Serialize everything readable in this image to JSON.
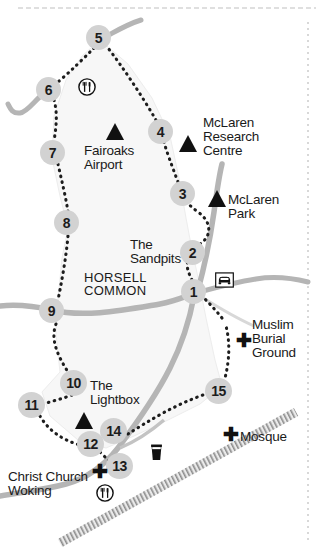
{
  "map": {
    "title": "Horsell Common walking route map",
    "background_color": "#ffffff",
    "land_color": "#f6f6f6",
    "road_color": "#b3b3b3",
    "marker_fill": "#d2d2d2",
    "marker_text_color": "#1c1c1c",
    "trail_color": "#1d1d1d",
    "railway_color": "#8a8a8a",
    "border_color": "#c9c9c9"
  },
  "markers": [
    {
      "id": "1",
      "label": "1",
      "x": 193,
      "y": 291
    },
    {
      "id": "2",
      "label": "2",
      "x": 192,
      "y": 252
    },
    {
      "id": "3",
      "label": "3",
      "x": 182,
      "y": 193
    },
    {
      "id": "4",
      "label": "4",
      "x": 160,
      "y": 131
    },
    {
      "id": "5",
      "label": "5",
      "x": 98,
      "y": 37
    },
    {
      "id": "6",
      "label": "6",
      "x": 48,
      "y": 89
    },
    {
      "id": "7",
      "label": "7",
      "x": 52,
      "y": 152
    },
    {
      "id": "8",
      "label": "8",
      "x": 66,
      "y": 222
    },
    {
      "id": "9",
      "label": "9",
      "x": 51,
      "y": 310
    },
    {
      "id": "10",
      "label": "10",
      "x": 73,
      "y": 382
    },
    {
      "id": "11",
      "label": "11",
      "x": 31,
      "y": 404
    },
    {
      "id": "12",
      "label": "12",
      "x": 90,
      "y": 443
    },
    {
      "id": "13",
      "label": "13",
      "x": 119,
      "y": 465
    },
    {
      "id": "14",
      "label": "14",
      "x": 113,
      "y": 430
    },
    {
      "id": "15",
      "label": "15",
      "x": 218,
      "y": 390
    }
  ],
  "labels": [
    {
      "name": "fairoaks-airport",
      "text": "Fairoaks\nAirport",
      "x": 84,
      "y": 154,
      "style": "place",
      "align": "left"
    },
    {
      "name": "mclaren-research-centre",
      "text": "McLaren\nResearch\nCentre",
      "x": 203,
      "y": 121,
      "style": "place",
      "align": "left"
    },
    {
      "name": "mclaren-park",
      "text": "McLaren\nPark",
      "x": 228,
      "y": 198,
      "style": "place",
      "align": "left"
    },
    {
      "name": "the-sandpits",
      "text": "The\nSandpits",
      "x": 130,
      "y": 243,
      "style": "place",
      "align": "left"
    },
    {
      "name": "horsell-common",
      "text": "HORSELL\nCOMMON",
      "x": 84,
      "y": 276,
      "style": "caps",
      "align": "left"
    },
    {
      "name": "muslim-burial-ground",
      "text": "Muslim\nBurial\nGround",
      "x": 252,
      "y": 325,
      "style": "place",
      "align": "left"
    },
    {
      "name": "the-lightbox",
      "text": "The\nLightbox",
      "x": 90,
      "y": 385,
      "style": "place",
      "align": "left"
    },
    {
      "name": "mosque",
      "text": "Mosque",
      "x": 240,
      "y": 437,
      "style": "place",
      "align": "left"
    },
    {
      "name": "christ-church-woking",
      "text": "Christ Church\nWoking",
      "x": 8,
      "y": 477,
      "style": "place",
      "align": "left"
    }
  ],
  "icons": [
    {
      "name": "restaurant-icon",
      "type": "restaurant",
      "x": 84,
      "y": 84,
      "title": "Restaurant"
    },
    {
      "name": "car-park-icon",
      "type": "car-park",
      "x": 222,
      "y": 280,
      "title": "Car park"
    },
    {
      "name": "pub-icon",
      "type": "pub",
      "x": 155,
      "y": 450,
      "title": "Pub"
    },
    {
      "name": "restaurant-icon-2",
      "type": "restaurant",
      "x": 102,
      "y": 490,
      "title": "Restaurant"
    }
  ],
  "crosses": [
    {
      "name": "cross-muslim-burial-ground",
      "x": 238,
      "y": 341
    },
    {
      "name": "cross-mosque",
      "x": 225,
      "y": 434
    },
    {
      "name": "cross-christ-church",
      "x": 94,
      "y": 471
    }
  ],
  "triangles": [
    {
      "name": "triangle-fairoaks-airport",
      "x": 115,
      "y": 131,
      "size": 15
    },
    {
      "name": "triangle-mclaren-research-centre",
      "x": 188,
      "y": 143,
      "size": 15
    },
    {
      "name": "triangle-mclaren-park",
      "x": 217,
      "y": 198,
      "size": 15
    },
    {
      "name": "triangle-the-lightbox",
      "x": 84,
      "y": 420,
      "size": 15
    }
  ],
  "legend": {
    "trail_description": "Dotted walking trail",
    "railway_description": "Railway line",
    "road_description": "Roads"
  }
}
